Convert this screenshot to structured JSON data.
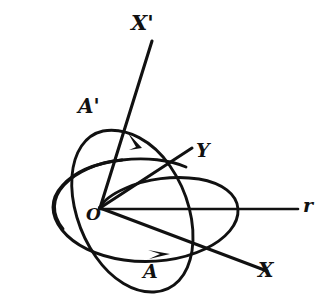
{
  "figure": {
    "background_color": "#ffffff",
    "ink_color": "#111111",
    "labels": {
      "x_prime": "X'",
      "a_prime": "A'",
      "y": "Y",
      "r": "r",
      "origin": "O",
      "a": "A",
      "x": "X"
    },
    "rays": [
      {
        "name": "x-prime-axis",
        "label": "X'",
        "from": [
          100,
          208
        ],
        "to": [
          152,
          40
        ]
      },
      {
        "name": "y-axis",
        "label": "Y",
        "from": [
          100,
          208
        ],
        "to": [
          192,
          148
        ]
      },
      {
        "name": "r-radius",
        "label": "r",
        "from": [
          100,
          209
        ],
        "to": [
          297,
          209
        ]
      },
      {
        "name": "x-axis",
        "label": "X",
        "from": [
          100,
          208
        ],
        "to": [
          266,
          270
        ]
      }
    ],
    "orbits": [
      {
        "name": "orbit-a-prime",
        "label": "A'",
        "orientation": "steeply tilted, upper-left to lower-right",
        "arrow_label": "A'",
        "arrow_direction": "clockwise-descending at top"
      },
      {
        "name": "orbit-a",
        "label": "A",
        "orientation": "shallow, nearly horizontal",
        "arrow_label": "A",
        "arrow_direction": "rightward along bottom"
      }
    ],
    "origin_point": [
      100,
      208
    ]
  }
}
